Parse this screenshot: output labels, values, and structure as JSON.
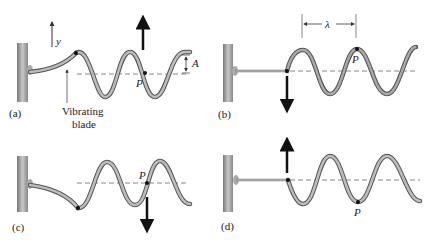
{
  "figure": {
    "panels": [
      {
        "id": "a",
        "label": "(a)",
        "point_label": "P",
        "axis_label": "y",
        "amplitude_label": "A",
        "caption_line1": "Vibrating",
        "caption_line2": "blade",
        "arrow": "up"
      },
      {
        "id": "b",
        "label": "(b)",
        "point_label": "P",
        "wavelength_label": "λ",
        "arrow": "down"
      },
      {
        "id": "c",
        "label": "(c)",
        "point_label": "P",
        "arrow": "down"
      },
      {
        "id": "d",
        "label": "(d)",
        "point_label": "P",
        "arrow": "up"
      }
    ],
    "colors": {
      "rope_outer": "#555555",
      "rope_inner": "#bdbdbd",
      "wall": "#9a9a9a",
      "arrow": "#111111",
      "dashed": "#888888"
    }
  }
}
